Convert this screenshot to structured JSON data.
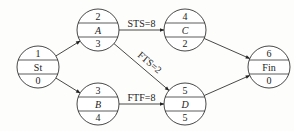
{
  "diagram": {
    "type": "precedence-network",
    "nodes": [
      {
        "id": "St",
        "top": "1",
        "label": "St",
        "bottom": "0",
        "italic": false,
        "cx": 38,
        "cy": 67
      },
      {
        "id": "A",
        "top": "2",
        "label": "A",
        "bottom": "3",
        "italic": true,
        "cx": 98,
        "cy": 30
      },
      {
        "id": "B",
        "top": "3",
        "label": "B",
        "bottom": "4",
        "italic": true,
        "cx": 98,
        "cy": 104
      },
      {
        "id": "C",
        "top": "4",
        "label": "C",
        "bottom": "2",
        "italic": true,
        "cx": 185,
        "cy": 30
      },
      {
        "id": "D",
        "top": "5",
        "label": "D",
        "bottom": "5",
        "italic": true,
        "cx": 185,
        "cy": 104
      },
      {
        "id": "Fin",
        "top": "6",
        "label": "Fin",
        "bottom": "0",
        "italic": false,
        "cx": 269,
        "cy": 67
      }
    ],
    "edges": [
      {
        "from": "St",
        "to": "A",
        "label": ""
      },
      {
        "from": "St",
        "to": "B",
        "label": ""
      },
      {
        "from": "A",
        "to": "C",
        "label": "STS=8"
      },
      {
        "from": "A",
        "to": "D",
        "label": "FTS=2"
      },
      {
        "from": "B",
        "to": "D",
        "label": "FTF=8"
      },
      {
        "from": "C",
        "to": "Fin",
        "label": ""
      },
      {
        "from": "D",
        "to": "Fin",
        "label": ""
      }
    ],
    "colors": {
      "line": "#333333",
      "text": "#222222",
      "background": "#fdfdfc"
    }
  }
}
